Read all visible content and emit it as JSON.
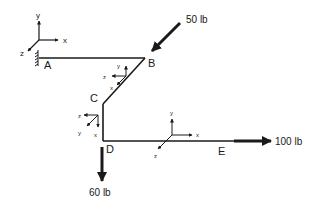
{
  "diagram": {
    "type": "3D bent bar / pipe structure with applied forces",
    "colors": {
      "ink": "#1a1a1a",
      "background": "#ffffff"
    },
    "points": [
      {
        "id": "A",
        "label": "A",
        "role": "fixed support"
      },
      {
        "id": "B",
        "label": "B"
      },
      {
        "id": "C",
        "label": "C"
      },
      {
        "id": "D",
        "label": "D"
      },
      {
        "id": "E",
        "label": "E"
      }
    ],
    "members": [
      {
        "from": "A",
        "to": "B"
      },
      {
        "from": "B",
        "to": "C"
      },
      {
        "from": "C",
        "to": "D"
      },
      {
        "from": "D",
        "to": "E"
      }
    ],
    "forces": [
      {
        "at": "B",
        "label": "50 lb",
        "direction": "down-left along member BC"
      },
      {
        "at": "D",
        "label": "60 lb",
        "direction": "downward"
      },
      {
        "at": "E",
        "label": "100 lb",
        "direction": "right (+x)"
      }
    ],
    "coordinate_systems": [
      {
        "name": "global",
        "at": "A",
        "axes": {
          "x": "x",
          "y": "y",
          "z": "z"
        }
      },
      {
        "name": "local-BC",
        "at": "between B and C",
        "axes": {
          "x": "x",
          "y": "y",
          "z": "z"
        }
      },
      {
        "name": "local-CD",
        "at": "between C and D",
        "axes": {
          "x": "x",
          "y": "y",
          "z": "z"
        }
      },
      {
        "name": "local-DE",
        "at": "along DE",
        "axes": {
          "x": "x",
          "y": "y",
          "z": "z"
        }
      }
    ]
  }
}
